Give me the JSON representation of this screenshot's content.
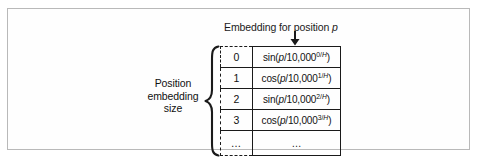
{
  "figure": {
    "header_caption_prefix": "Embedding for position ",
    "header_caption_variable": "p",
    "arrow_icon": "down-arrow-icon",
    "brace_icon": "curly-brace-icon",
    "size_label_line1": "Position",
    "size_label_line2": "embedding",
    "size_label_line3": "size",
    "ellipsis": "…"
  },
  "table": {
    "rows": [
      {
        "index": "0",
        "func": "sin",
        "open": "(",
        "variable": "p",
        "divider": "/10,000",
        "exponent": "0/",
        "exponent_var": "H",
        "close": ")"
      },
      {
        "index": "1",
        "func": "cos",
        "open": "(",
        "variable": "p",
        "divider": "/10,000",
        "exponent": "1/",
        "exponent_var": "H",
        "close": ")"
      },
      {
        "index": "2",
        "func": "sin",
        "open": "(",
        "variable": "p",
        "divider": "/10,000",
        "exponent": "2/",
        "exponent_var": "H",
        "close": ")"
      },
      {
        "index": "3",
        "func": "cos",
        "open": "(",
        "variable": "p",
        "divider": "/10,000",
        "exponent": "3/",
        "exponent_var": "H",
        "close": ")"
      },
      {
        "index": "…",
        "func": "",
        "open": "",
        "variable": "",
        "divider": "…",
        "exponent": "",
        "exponent_var": "",
        "close": ""
      }
    ]
  },
  "colors": {
    "frame_border": "#b9b9b9",
    "ink": "#1a1a1a",
    "background": "#ffffff"
  }
}
